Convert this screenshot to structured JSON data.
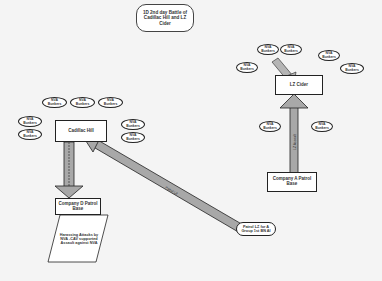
{
  "title": "1D 2nd day Battle of Cadillac Hill and LZ Cider",
  "nodes": {
    "cadillac_hill": "Cadillac Hill",
    "company_d": "Company D Patrol Base",
    "harassing": "Harassing Attacks by NVA -CAV supported Assault against NVA",
    "patrol_lz": "Patrol LZ for A Group 1st BN AI",
    "lz_cider": "LZ Cider",
    "company_a": "Company A Patrol Base"
  },
  "bunker_label": "NVA Bunkers",
  "arrows": {
    "left_vertical": "",
    "diagonal": "Patrol LZ",
    "right_vertical": "LZ Assault",
    "right_diagonal": "Assault"
  },
  "colors": {
    "arrow_fill": "#a8a8a8",
    "arrow_stroke": "#222222",
    "background": "#f4f4f4"
  }
}
